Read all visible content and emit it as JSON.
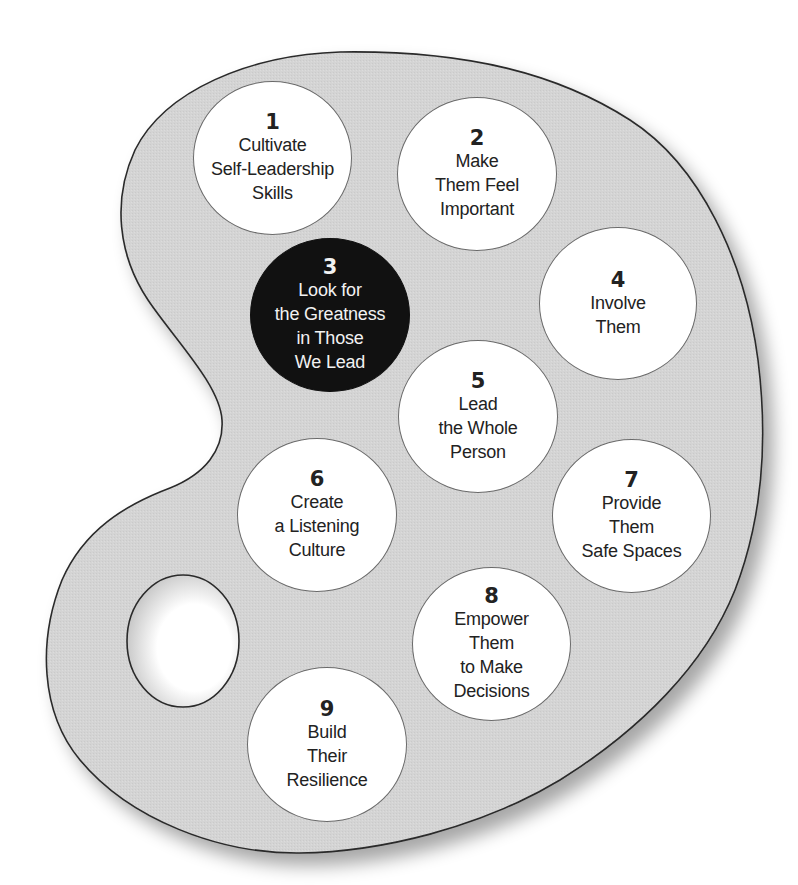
{
  "figure": {
    "type": "artist-palette-diagram",
    "colors": {
      "palette_fill": "#d3d3d3",
      "palette_stroke": "#2a2a2a",
      "paint_fill": "#ffffff",
      "highlight_fill": "#111111",
      "highlight_text": "#f2f2f2",
      "text": "#222222"
    },
    "items": [
      {
        "number": "1",
        "lines": [
          "Cultivate",
          "Self-Leadership",
          "Skills"
        ],
        "highlighted": false
      },
      {
        "number": "2",
        "lines": [
          "Make",
          "Them Feel",
          "Important"
        ],
        "highlighted": false
      },
      {
        "number": "3",
        "lines": [
          "Look for",
          "the Greatness",
          "in Those",
          "We Lead"
        ],
        "highlighted": true
      },
      {
        "number": "4",
        "lines": [
          "Involve",
          "Them"
        ],
        "highlighted": false
      },
      {
        "number": "5",
        "lines": [
          "Lead",
          "the Whole",
          "Person"
        ],
        "highlighted": false
      },
      {
        "number": "6",
        "lines": [
          "Create",
          "a Listening",
          "Culture"
        ],
        "highlighted": false
      },
      {
        "number": "7",
        "lines": [
          "Provide",
          "Them",
          "Safe Spaces"
        ],
        "highlighted": false
      },
      {
        "number": "8",
        "lines": [
          "Empower",
          "Them",
          "to Make",
          "Decisions"
        ],
        "highlighted": false
      },
      {
        "number": "9",
        "lines": [
          "Build",
          "Their",
          "Resilience"
        ],
        "highlighted": false
      }
    ]
  }
}
